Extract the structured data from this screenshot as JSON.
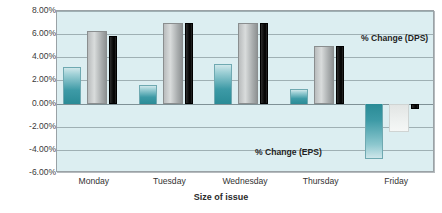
{
  "chart_data": {
    "type": "bar",
    "title": "",
    "xlabel": "Size of issue",
    "ylabel": "",
    "categories": [
      "Monday",
      "Tuesday",
      "Wednesday",
      "Thursday",
      "Friday"
    ],
    "series": [
      {
        "name": "% Change (EPS)",
        "color": "#3d9aa6",
        "values": [
          3.2,
          1.6,
          3.4,
          1.3,
          -4.8
        ]
      },
      {
        "name": "middle-series",
        "color": "#b9bcbd",
        "values": [
          6.3,
          7.0,
          7.0,
          5.0,
          -2.5
        ]
      },
      {
        "name": "% Change (DPS)",
        "color": "#000000",
        "values": [
          5.8,
          7.0,
          7.0,
          5.0,
          -0.5
        ]
      }
    ],
    "ylim": [
      -6,
      8
    ],
    "ytick_values": [
      8,
      6,
      4,
      2,
      0,
      -2,
      -4,
      -6
    ],
    "ytick_labels": [
      "8.00%",
      "6.00%",
      "4.00%",
      "2.00%",
      "0.00%",
      "-2.00%",
      "-4.00%",
      "-6.00%"
    ],
    "grid": true,
    "legend_position": "in-plot-annotations",
    "annotations": [
      {
        "text": "% Change (DPS)",
        "x": 4.02,
        "y": 5.55
      },
      {
        "text": "% Change (EPS)",
        "x": 2.62,
        "y": -4.25
      }
    ]
  }
}
